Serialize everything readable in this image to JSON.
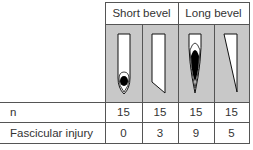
{
  "table": {
    "groups": [
      {
        "label": "Short bevel",
        "span": 2
      },
      {
        "label": "Long bevel",
        "span": 2
      }
    ],
    "needles": [
      {
        "group": "Short bevel",
        "view": "front",
        "icon": "short-bevel-front-needle-icon"
      },
      {
        "group": "Short bevel",
        "view": "side",
        "icon": "short-bevel-side-needle-icon"
      },
      {
        "group": "Long bevel",
        "view": "front",
        "icon": "long-bevel-front-needle-icon"
      },
      {
        "group": "Long bevel",
        "view": "side",
        "icon": "long-bevel-side-needle-icon"
      }
    ],
    "rows": [
      {
        "label": "n",
        "values": [
          "15",
          "15",
          "15",
          "15"
        ]
      },
      {
        "label": "Fascicular injury",
        "values": [
          "0",
          "3",
          "9",
          "5"
        ]
      }
    ]
  },
  "colors": {
    "image_row_bg": "#c8c8c8",
    "grid_line": "#555555",
    "needle_fill": "#ffffff",
    "lumen_fill": "#000000"
  }
}
